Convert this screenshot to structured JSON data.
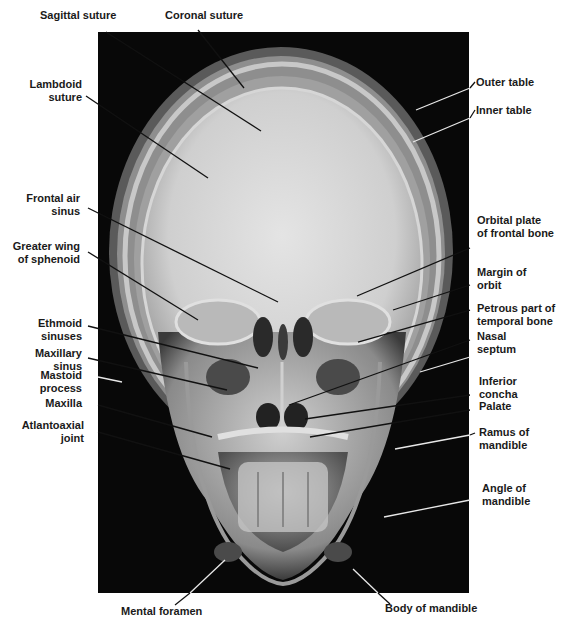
{
  "figure": {
    "colors": {
      "background": "#ffffff",
      "film": "#080808",
      "bone": "#d8d8d8",
      "label_text": "#1a1a1a"
    }
  },
  "labels": {
    "top": [
      {
        "id": "sagittal-suture",
        "text": "Sagittal suture"
      },
      {
        "id": "coronal-suture",
        "text": "Coronal suture"
      }
    ],
    "left": [
      {
        "id": "lambdoid-suture",
        "line1": "Lambdoid",
        "line2": "suture"
      },
      {
        "id": "frontal-air-sinus",
        "line1": "Frontal air",
        "line2": "sinus"
      },
      {
        "id": "greater-wing-of-sphenoid",
        "line1": "Greater wing",
        "line2": "of sphenoid"
      },
      {
        "id": "ethmoid-sinuses",
        "line1": "Ethmoid",
        "line2": "sinuses"
      },
      {
        "id": "maxillary-sinus",
        "line1": "Maxillary",
        "line2": "sinus"
      },
      {
        "id": "mastoid-process",
        "line1": "Mastoid",
        "line2": "process"
      },
      {
        "id": "maxilla",
        "line1": "Maxilla",
        "line2": ""
      },
      {
        "id": "atlantoaxial-joint",
        "line1": "Atlantoaxial",
        "line2": "joint"
      }
    ],
    "right": [
      {
        "id": "outer-table",
        "line1": "Outer table",
        "line2": ""
      },
      {
        "id": "inner-table",
        "line1": "Inner table",
        "line2": ""
      },
      {
        "id": "orbital-plate-of-frontal-bone",
        "line1": "Orbital plate",
        "line2": "of frontal bone"
      },
      {
        "id": "margin-of-orbit",
        "line1": "Margin of",
        "line2": "orbit"
      },
      {
        "id": "petrous-part-of-temporal-bone",
        "line1": "Petrous part of",
        "line2": "temporal bone"
      },
      {
        "id": "nasal-septum",
        "line1": "Nasal",
        "line2": "septum"
      },
      {
        "id": "inferior-concha",
        "line1": "Inferior",
        "line2": "concha"
      },
      {
        "id": "palate",
        "line1": "Palate",
        "line2": ""
      },
      {
        "id": "ramus-of-mandible",
        "line1": "Ramus of",
        "line2": "mandible"
      },
      {
        "id": "angle-of-mandible",
        "line1": "Angle of",
        "line2": "mandible"
      }
    ],
    "bottom": [
      {
        "id": "mental-foramen",
        "text": "Mental foramen"
      },
      {
        "id": "body-of-mandible",
        "text": "Body of mandible"
      }
    ]
  }
}
